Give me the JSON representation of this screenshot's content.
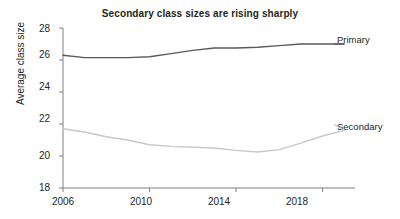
{
  "chart_data": {
    "type": "line",
    "title": "Secondary class sizes are rising sharply",
    "xlabel": "",
    "ylabel": "Average class size",
    "xlim": [
      2006,
      2019.5
    ],
    "ylim": [
      18,
      28
    ],
    "grid": false,
    "legend_position": "right-inline-labels",
    "x_tick_labels": [
      "2006",
      "2010",
      "2014",
      "2018"
    ],
    "x_ticks": [
      2006,
      2010,
      2014,
      2018
    ],
    "y_tick_labels": [
      "18",
      "20",
      "22",
      "24",
      "26",
      "28"
    ],
    "y_ticks": [
      18,
      20,
      22,
      24,
      26,
      28
    ],
    "x": [
      2006,
      2007,
      2008,
      2009,
      2010,
      2011,
      2012,
      2013,
      2014,
      2015,
      2016,
      2017,
      2018,
      2019
    ],
    "series": [
      {
        "name": "Primary",
        "color": "#595959",
        "values": [
          26.3,
          26.15,
          26.15,
          26.15,
          26.2,
          26.4,
          26.6,
          26.75,
          26.75,
          26.8,
          26.9,
          27.0,
          27.0,
          27.0
        ]
      },
      {
        "name": "Secondary",
        "color": "#c8c8c8",
        "values": [
          21.7,
          21.5,
          21.2,
          21.0,
          20.7,
          20.6,
          20.55,
          20.5,
          20.35,
          20.25,
          20.4,
          20.8,
          21.25,
          21.6
        ]
      }
    ]
  }
}
